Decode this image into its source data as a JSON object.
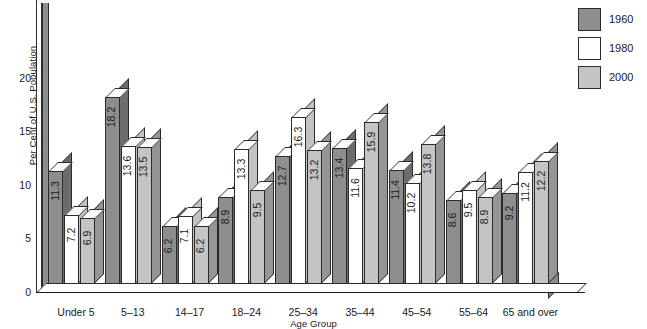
{
  "chart_data": {
    "type": "bar",
    "title": "",
    "xlabel": "Age Group",
    "ylabel": "Per Cent of U.S. Population",
    "ylim": [
      0,
      24.5
    ],
    "yticks": [
      0,
      5,
      10,
      15,
      20
    ],
    "ytick_labels": [
      "0",
      "5",
      "10",
      "15",
      "20"
    ],
    "grid": false,
    "legend_position": "top-right",
    "categories": [
      "Under 5",
      "5–13",
      "14–17",
      "18–24",
      "25–34",
      "35–44",
      "45–54",
      "55–64",
      "65 and over"
    ],
    "series": [
      {
        "name": "1960",
        "color": "#8e8e8e",
        "values": [
          11.3,
          18.2,
          6.2,
          8.9,
          12.7,
          13.4,
          11.4,
          8.6,
          9.2
        ],
        "labels": [
          "11.3",
          "18.2",
          "6.2",
          "8.9",
          "12.7",
          "13.4",
          "11.4",
          "8.6",
          "9.2"
        ]
      },
      {
        "name": "1980",
        "color": "#ffffff",
        "values": [
          7.2,
          13.6,
          7.1,
          13.3,
          16.3,
          11.6,
          10.2,
          9.5,
          11.2
        ],
        "labels": [
          "7.2",
          "13.6",
          "7.1",
          "13.3",
          "16.3",
          "11.6",
          "10.2",
          "9.5",
          "11.2"
        ]
      },
      {
        "name": "2000",
        "color": "#c4c4c4",
        "values": [
          6.9,
          13.5,
          6.2,
          9.5,
          13.2,
          15.9,
          13.8,
          8.9,
          12.2
        ],
        "labels": [
          "6.9",
          "13.5",
          "6.2",
          "9.5",
          "13.2",
          "15.9",
          "13.8",
          "8.9",
          "12.2"
        ]
      }
    ]
  },
  "legend": {
    "entries": [
      {
        "label": "1960",
        "swatch_name": "legend-swatch-1960"
      },
      {
        "label": "1980",
        "swatch_name": "legend-swatch-1980"
      },
      {
        "label": "2000",
        "swatch_name": "legend-swatch-2000"
      }
    ]
  },
  "axes": {
    "y_title": "Per Cent of U.S. Population",
    "x_title": "Age Group"
  },
  "colors": {
    "series_1960": "#8e8e8e",
    "series_1980": "#ffffff",
    "series_2000": "#c4c4c4",
    "outline": "#2b2b2b",
    "side_dark": "#6f6f6f",
    "background": "#ffffff"
  }
}
